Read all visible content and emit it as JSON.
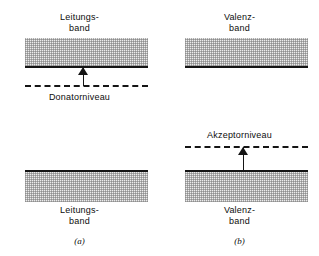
{
  "figure": {
    "ink_color": "#151515",
    "band_fill_color": "#ececec",
    "background_color": "#ffffff"
  },
  "panels": [
    {
      "caption": "(a)",
      "upper_band": {
        "label_line1": "Leitungs-",
        "label_line2": "band"
      },
      "lower_band": {
        "label_line1": "Leitungs-",
        "label_line2": "band"
      },
      "impurity_level": {
        "label": "Donatorniveau",
        "line_style": "dashed",
        "label_position": "below"
      },
      "arrow": {
        "direction": "up",
        "from": "Donatorniveau",
        "to": "Leitungsband"
      }
    },
    {
      "caption": "(b)",
      "upper_band": {
        "label_line1": "Valenz-",
        "label_line2": "band"
      },
      "lower_band": {
        "label_line1": "Valenz-",
        "label_line2": "band"
      },
      "impurity_level": {
        "label": "Akzeptorniveau",
        "line_style": "dashed",
        "label_position": "above"
      },
      "arrow": {
        "direction": "up",
        "from": "Valenzband",
        "to": "Akzeptorniveau"
      }
    }
  ]
}
